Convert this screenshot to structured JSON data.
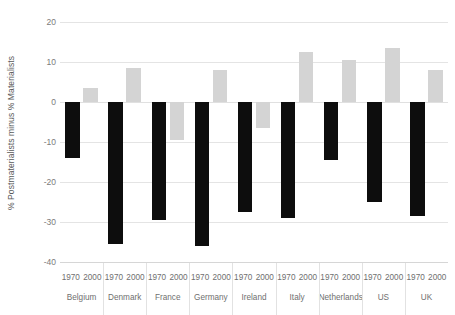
{
  "chart_data": {
    "type": "bar",
    "title": "",
    "subtitle": "",
    "xlabel": "",
    "ylabel": "% Postmaterialists minus % Materialists",
    "ylim": [
      -40,
      20
    ],
    "ytick_values": [
      20,
      10,
      0,
      -10,
      -20,
      -30,
      -40
    ],
    "ytick_labels": [
      "20",
      "10",
      "0",
      "-10",
      "-20",
      "-30",
      "-40"
    ],
    "grid": true,
    "legend": "none",
    "categories": [
      "Belgium",
      "Denmark",
      "France",
      "Germany",
      "Ireland",
      "Italy",
      "Netherlands",
      "US",
      "UK"
    ],
    "sub_categories": [
      "1970",
      "2000"
    ],
    "series": [
      {
        "name": "1970",
        "color": "#0d0d0d",
        "values": [
          -14,
          -35.5,
          -29.5,
          -36,
          -27.5,
          -29,
          -14.5,
          -25,
          -28.5
        ]
      },
      {
        "name": "2000",
        "color": "#d4d4d4",
        "values": [
          3.5,
          8.5,
          -9.5,
          8,
          -6.5,
          12.5,
          10.5,
          13.5,
          8
        ]
      }
    ]
  },
  "axis": {
    "y_title": "% Postmaterialists minus % Materialists"
  },
  "colors": {
    "series_1970": "#0d0d0d",
    "series_2000": "#d4d4d4",
    "gridline": "#e4e4e4",
    "text": "#6f6f6f",
    "background": "#ffffff"
  }
}
